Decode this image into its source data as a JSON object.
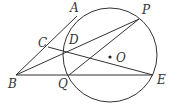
{
  "diagram": {
    "type": "geometry",
    "circle": {
      "center": "O",
      "cx": 110,
      "cy": 55,
      "r": 47
    },
    "points": {
      "A": {
        "x": 77,
        "y": 16,
        "label": "A",
        "lx": 70,
        "ly": 12
      },
      "P": {
        "x": 139,
        "y": 19,
        "label": "P",
        "lx": 142,
        "ly": 14
      },
      "C": {
        "x": 48,
        "y": 47,
        "label": "C",
        "lx": 38,
        "ly": 47
      },
      "D": {
        "x": 66,
        "y": 52,
        "label": "D",
        "lx": 69,
        "ly": 44
      },
      "O": {
        "x": 110,
        "y": 57,
        "label": "O",
        "lx": 116,
        "ly": 62
      },
      "B": {
        "x": 16,
        "y": 75,
        "label": "B",
        "lx": 8,
        "ly": 88
      },
      "Q": {
        "x": 69,
        "y": 75,
        "label": "Q",
        "lx": 58,
        "ly": 88
      },
      "E": {
        "x": 153,
        "y": 75,
        "label": "E",
        "lx": 157,
        "ly": 84
      }
    },
    "segments": [
      [
        "B",
        "A"
      ],
      [
        "B",
        "P"
      ],
      [
        "B",
        "E"
      ],
      [
        "C",
        "E"
      ],
      [
        "Q",
        "P"
      ]
    ]
  }
}
